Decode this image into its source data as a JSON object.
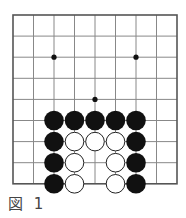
{
  "diagram": {
    "type": "go-board-partial",
    "caption": "図 1",
    "grid": {
      "columns": 9,
      "rows": 9,
      "origin_x": 13,
      "origin_y": 15,
      "spacing_x": 20.5,
      "spacing_y": 21.1,
      "line_color": "#888888",
      "border_color": "#555555"
    },
    "hoshi": [
      {
        "col": 2,
        "row": 2
      },
      {
        "col": 6,
        "row": 2
      },
      {
        "col": 4,
        "row": 4
      }
    ],
    "stones": [
      {
        "col": 2,
        "row": 5,
        "color": "black"
      },
      {
        "col": 3,
        "row": 5,
        "color": "black"
      },
      {
        "col": 4,
        "row": 5,
        "color": "black"
      },
      {
        "col": 5,
        "row": 5,
        "color": "black"
      },
      {
        "col": 6,
        "row": 5,
        "color": "black"
      },
      {
        "col": 2,
        "row": 6,
        "color": "black"
      },
      {
        "col": 3,
        "row": 6,
        "color": "white"
      },
      {
        "col": 4,
        "row": 6,
        "color": "white"
      },
      {
        "col": 5,
        "row": 6,
        "color": "white"
      },
      {
        "col": 6,
        "row": 6,
        "color": "black"
      },
      {
        "col": 2,
        "row": 7,
        "color": "black"
      },
      {
        "col": 3,
        "row": 7,
        "color": "white"
      },
      {
        "col": 5,
        "row": 7,
        "color": "white"
      },
      {
        "col": 6,
        "row": 7,
        "color": "black"
      },
      {
        "col": 2,
        "row": 8,
        "color": "black"
      },
      {
        "col": 3,
        "row": 8,
        "color": "white"
      },
      {
        "col": 5,
        "row": 8,
        "color": "white"
      },
      {
        "col": 6,
        "row": 8,
        "color": "black"
      }
    ],
    "colors": {
      "black_stone": "#111111",
      "white_stone_fill": "#ffffff",
      "white_stone_stroke": "#222222"
    }
  }
}
